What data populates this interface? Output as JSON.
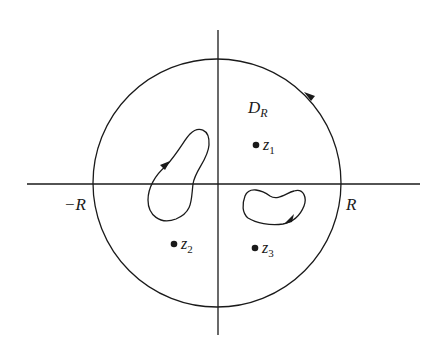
{
  "diagram": {
    "type": "complex-plane contour diagram",
    "colors": {
      "stroke": "#1a1a1a",
      "background": "#ffffff"
    },
    "axes": {
      "horizontal": {
        "label_left": "−R",
        "label_right": "R"
      },
      "vertical": {}
    },
    "region": {
      "label_main": "D",
      "label_sub": "R",
      "shape": "circle",
      "orientation": "counterclockwise"
    },
    "contours": [
      {
        "name": "left-contour",
        "orientation": "clockwise"
      },
      {
        "name": "right-contour",
        "orientation": "clockwise"
      }
    ],
    "points": [
      {
        "name": "z1",
        "label_main": "z",
        "label_sub": "1"
      },
      {
        "name": "z2",
        "label_main": "z",
        "label_sub": "2"
      },
      {
        "name": "z3",
        "label_main": "z",
        "label_sub": "3"
      }
    ]
  }
}
